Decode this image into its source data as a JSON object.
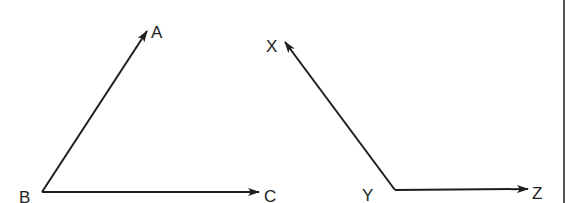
{
  "diagram": {
    "type": "two angles with ray arrows",
    "colors": {
      "stroke": "#1e1e1e",
      "label": "#222222",
      "background": "#ffffff",
      "border": "#555555"
    },
    "angles": [
      {
        "name": "angle-ABC",
        "vertex": {
          "label": "B",
          "x": 42,
          "y": 192
        },
        "rays": [
          {
            "label": "A",
            "to": {
              "x": 147,
              "y": 30
            }
          },
          {
            "label": "C",
            "to": {
              "x": 259,
              "y": 192
            }
          }
        ]
      },
      {
        "name": "angle-XYZ",
        "vertex": {
          "label": "Y",
          "x": 395,
          "y": 190
        },
        "rays": [
          {
            "label": "X",
            "to": {
              "x": 284,
              "y": 42
            }
          },
          {
            "label": "Z",
            "to": {
              "x": 528,
              "y": 190
            }
          }
        ]
      }
    ],
    "labels": {
      "A": "A",
      "B": "B",
      "C": "C",
      "X": "X",
      "Y": "Y",
      "Z": "Z"
    }
  }
}
